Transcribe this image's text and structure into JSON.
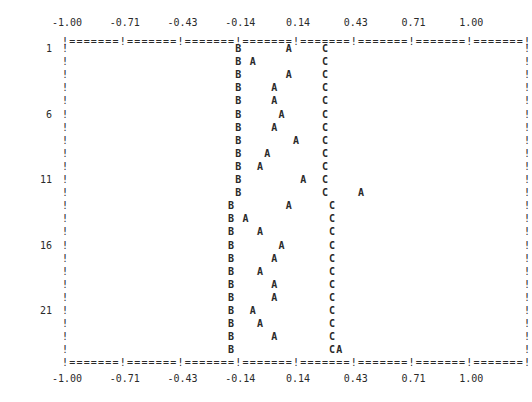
{
  "chart_data": {
    "type": "scatter",
    "style": "line-printer character plot",
    "title": "",
    "xlabel": "",
    "ylabel": "",
    "xlim": [
      -1.0,
      1.0
    ],
    "x_tick_labels": [
      "-1.00",
      "-0.71",
      "-0.43",
      "-0.14",
      "0.14",
      "0.43",
      "0.71",
      "1.00"
    ],
    "x_ticks": [
      -1.0,
      -0.71,
      -0.43,
      -0.14,
      0.14,
      0.43,
      0.71,
      1.0
    ],
    "y_row_labels": [
      {
        "row": 1,
        "label": "1"
      },
      {
        "row": 6,
        "label": "6"
      },
      {
        "row": 11,
        "label": "11"
      },
      {
        "row": 16,
        "label": "16"
      },
      {
        "row": 21,
        "label": "21"
      }
    ],
    "n_rows": 24,
    "grid": false,
    "border_segment": "!=======",
    "series": [
      {
        "name": "A",
        "symbol": "A",
        "x": [
          0.0,
          -0.21,
          0.0,
          -0.1,
          -0.1,
          -0.06,
          -0.1,
          0.03,
          -0.13,
          -0.17,
          0.04,
          0.29,
          0.0,
          -0.21,
          -0.13,
          -0.06,
          -0.1,
          -0.13,
          -0.1,
          -0.1,
          -0.17,
          -0.13,
          -0.1,
          0.2
        ]
      },
      {
        "name": "B",
        "symbol": "B",
        "x": [
          -0.25,
          -0.25,
          -0.25,
          -0.25,
          -0.25,
          -0.25,
          -0.25,
          -0.25,
          -0.25,
          -0.25,
          -0.25,
          -0.25,
          -0.28,
          -0.28,
          -0.28,
          -0.28,
          -0.28,
          -0.28,
          -0.28,
          -0.28,
          -0.28,
          -0.28,
          -0.28,
          -0.28
        ]
      },
      {
        "name": "C",
        "symbol": "C",
        "x": [
          0.13,
          0.13,
          0.13,
          0.13,
          0.13,
          0.13,
          0.13,
          0.13,
          0.13,
          0.13,
          0.13,
          0.13,
          0.16,
          0.16,
          0.16,
          0.16,
          0.16,
          0.16,
          0.16,
          0.16,
          0.16,
          0.16,
          0.16,
          0.16
        ]
      }
    ],
    "rows": [
      {
        "row": 1,
        "B": 24,
        "A": 31,
        "C": 36
      },
      {
        "row": 2,
        "B": 24,
        "A": 26,
        "C": 36
      },
      {
        "row": 3,
        "B": 24,
        "A": 31,
        "C": 36
      },
      {
        "row": 4,
        "B": 24,
        "A": 29,
        "C": 36
      },
      {
        "row": 5,
        "B": 24,
        "A": 29,
        "C": 36
      },
      {
        "row": 6,
        "B": 24,
        "A": 30,
        "C": 36
      },
      {
        "row": 7,
        "B": 24,
        "A": 29,
        "C": 36
      },
      {
        "row": 8,
        "B": 24,
        "A": 32,
        "C": 36
      },
      {
        "row": 9,
        "B": 24,
        "A": 28,
        "C": 36
      },
      {
        "row": 10,
        "B": 24,
        "A": 27,
        "C": 36
      },
      {
        "row": 11,
        "B": 24,
        "A": 33,
        "C": 36
      },
      {
        "row": 12,
        "B": 24,
        "A": 41,
        "C": 36
      },
      {
        "row": 13,
        "B": 23,
        "A": 31,
        "C": 37
      },
      {
        "row": 14,
        "B": 23,
        "A": 25,
        "C": 37
      },
      {
        "row": 15,
        "B": 23,
        "A": 27,
        "C": 37
      },
      {
        "row": 16,
        "B": 23,
        "A": 30,
        "C": 37
      },
      {
        "row": 17,
        "B": 23,
        "A": 29,
        "C": 37
      },
      {
        "row": 18,
        "B": 23,
        "A": 27,
        "C": 37
      },
      {
        "row": 19,
        "B": 23,
        "A": 29,
        "C": 37
      },
      {
        "row": 20,
        "B": 23,
        "A": 29,
        "C": 37
      },
      {
        "row": 21,
        "B": 23,
        "A": 26,
        "C": 37
      },
      {
        "row": 22,
        "B": 23,
        "A": 27,
        "C": 37
      },
      {
        "row": 23,
        "B": 23,
        "A": 29,
        "C": 37
      },
      {
        "row": 24,
        "B": 23,
        "A": 38,
        "C": 37
      }
    ]
  },
  "layout": {
    "left_px": 65,
    "char_w": 7.22,
    "top_border_y": 41,
    "first_row_y": 48,
    "row_h": 13.1,
    "ink": "#2a2a2a"
  }
}
